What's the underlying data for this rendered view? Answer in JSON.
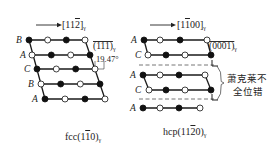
{
  "left_panel": {
    "caption": "fcc(1̅1̅0)",
    "caption_main": "fcc(1",
    "caption_bar": "1",
    "caption_end": "0)",
    "caption_sub": "γ",
    "direction_label": "[11",
    "direction_bar": "2",
    "direction_end": "]",
    "direction_sub": "γ",
    "plane_label": "(111)",
    "plane_sub": "γ",
    "angle_label": "19.47°",
    "rows": [
      {
        "label": "B",
        "pattern": [
          "filled",
          "open",
          "filled",
          "open"
        ]
      },
      {
        "label": "A",
        "pattern": [
          "open",
          "filled",
          "open",
          "filled"
        ]
      },
      {
        "label": "C",
        "pattern": [
          "filled",
          "open",
          "filled",
          "open"
        ]
      },
      {
        "label": "B",
        "pattern": [
          "open",
          "filled",
          "open",
          "filled"
        ]
      },
      {
        "label": "A",
        "pattern": [
          "filled",
          "open",
          "filled",
          "open"
        ]
      }
    ]
  },
  "right_panel": {
    "caption_main": "hcp(11",
    "caption_bar": "2",
    "caption_end": "0)",
    "caption_sub": "γ",
    "direction_label_a": "[1",
    "direction_bar": "1",
    "direction_label_b": "00]",
    "direction_sub": "γ",
    "plane_label": "(0001)",
    "plane_sub": "γ",
    "annotation_line1": "萧克莱不",
    "annotation_line2": "全位错",
    "rows": [
      {
        "label": "A",
        "pattern": [
          "filled",
          "open",
          "filled",
          "open"
        ]
      },
      {
        "label": "C",
        "pattern": [
          "open",
          "filled",
          "open",
          "filled"
        ]
      },
      {
        "label": "A",
        "pattern": [
          "filled",
          "open",
          "filled",
          "open"
        ]
      },
      {
        "label": "C",
        "pattern": [
          "open",
          "filled",
          "open",
          "filled"
        ]
      },
      {
        "label": "A",
        "pattern": [
          "filled",
          "open",
          "filled",
          "open"
        ]
      }
    ]
  },
  "colors": {
    "line": "#1a1a1a",
    "filled": "#111111",
    "open": "#ffffff",
    "dashed": "#666666"
  }
}
